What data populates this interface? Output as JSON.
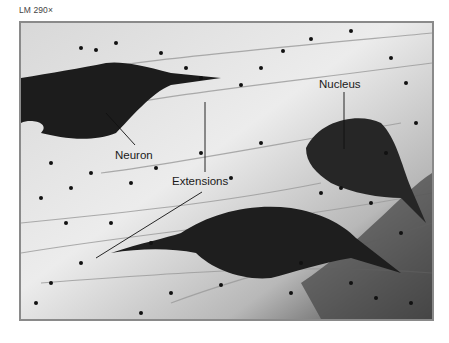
{
  "figure": {
    "magnification": "LM 290×",
    "labels": {
      "neuron": "Neuron",
      "extensions": "Extensions",
      "nucleus": "Nucleus"
    },
    "colors": {
      "frame_border": "#8a8a8a",
      "background_tissue": "#e6e6e6",
      "cell_stain": "#1c1c1c",
      "label_text": "#1a1a1a"
    }
  }
}
